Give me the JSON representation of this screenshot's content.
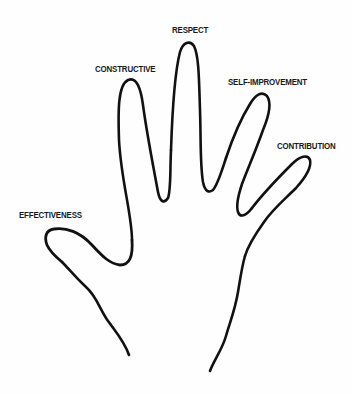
{
  "diagram": {
    "type": "hand-outline",
    "stroke_color": "#111111",
    "background": "#ffffff",
    "labels": {
      "thumb": "EFFECTIVENESS",
      "index": "CONSTRUCTIVE",
      "middle": "RESPECT",
      "ring": "SELF-IMPROVEMENT",
      "pinky": "CONTRIBUTION"
    }
  }
}
